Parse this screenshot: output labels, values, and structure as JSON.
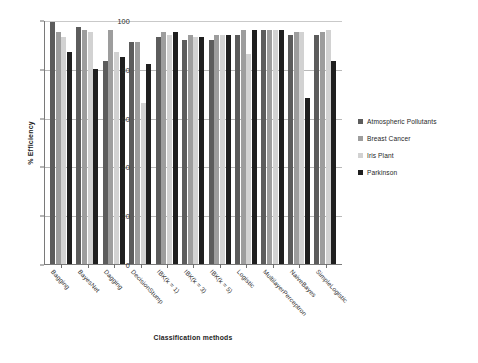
{
  "chart_data": {
    "type": "bar",
    "title": "",
    "xlabel": "Classification methods",
    "ylabel": "% Efficiency",
    "ylim": [
      0,
      100
    ],
    "yticks": [
      0,
      20,
      40,
      60,
      80,
      100
    ],
    "grid": true,
    "legend_position": "right",
    "categories": [
      "Bagging",
      "BayesNet",
      "Dagging",
      "DecisionStump",
      "IBK(k = 1)",
      "IBK(k = 3)",
      "IBK(k = 5)",
      "Logistic",
      "MultilayerPerceptron",
      "NaiveBayes",
      "SimpleLogistic"
    ],
    "series": [
      {
        "name": "Atmospheric Pollutants",
        "color": "#5c5c5c",
        "values": [
          99,
          97,
          83,
          91,
          93,
          92,
          92,
          94,
          96,
          94,
          94
        ]
      },
      {
        "name": "Breast Cancer",
        "color": "#9d9d9d",
        "values": [
          95,
          96,
          96,
          91,
          95,
          94,
          94,
          96,
          96,
          95,
          95
        ]
      },
      {
        "name": "Iris Plant",
        "color": "#d2d2d2",
        "values": [
          93,
          95,
          87,
          66,
          94,
          93,
          94,
          86,
          96,
          95,
          96
        ]
      },
      {
        "name": "Parkinson",
        "color": "#1f1f1f",
        "values": [
          87,
          80,
          85,
          82,
          95,
          93,
          94,
          96,
          96,
          68,
          83
        ]
      }
    ]
  },
  "legend": {
    "items": [
      {
        "label": "Atmospheric Pollutants",
        "color": "#5c5c5c"
      },
      {
        "label": "Breast Cancer",
        "color": "#9d9d9d"
      },
      {
        "label": "Iris Plant",
        "color": "#d2d2d2"
      },
      {
        "label": "Parkinson",
        "color": "#1f1f1f"
      }
    ]
  }
}
